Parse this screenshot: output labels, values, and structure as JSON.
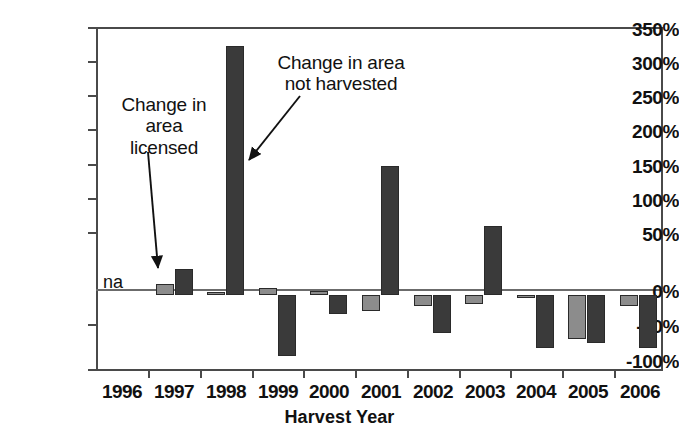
{
  "chart_data": {
    "type": "bar",
    "title": "",
    "xlabel": "Harvest Year",
    "ylabel": "",
    "categories": [
      "1996",
      "1997",
      "1998",
      "1999",
      "2000",
      "2001",
      "2002",
      "2003",
      "2004",
      "2005",
      "2006"
    ],
    "ylim": [
      -100,
      350
    ],
    "ytick_labels": [
      "350%",
      "300%",
      "250%",
      "200%",
      "150%",
      "100%",
      "50%",
      "0%",
      "-50%",
      "-100%"
    ],
    "ytick_values": [
      350,
      300,
      250,
      200,
      150,
      100,
      50,
      0,
      -50,
      -100
    ],
    "grid": false,
    "legend_position": "annotations",
    "series": [
      {
        "name": "Change in area licensed",
        "color": "#8c8c8c",
        "values": [
          null,
          14,
          3,
          8,
          5,
          -22,
          -15,
          -12,
          -4,
          -58,
          -15
        ]
      },
      {
        "name": "Change in area not harvested",
        "color": "#3a3a3a",
        "values": [
          null,
          34,
          325,
          -80,
          -25,
          168,
          -50,
          90,
          -70,
          -63,
          -70
        ]
      }
    ],
    "annotations": [
      {
        "id": "licensed",
        "text_lines": [
          "Change in",
          "area",
          "licensed"
        ],
        "points_to": "1997 light-gray bar"
      },
      {
        "id": "not-harvested",
        "text_lines": [
          "Change in area",
          "not harvested"
        ],
        "points_to": "1998 dark bar"
      },
      {
        "id": "na",
        "text": "na",
        "points_to": "1996 no data"
      }
    ]
  },
  "axis": {
    "x_title": "Harvest Year"
  }
}
